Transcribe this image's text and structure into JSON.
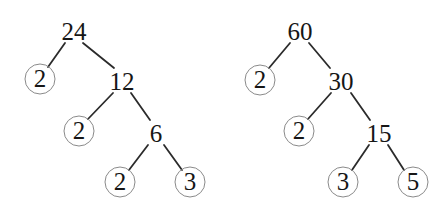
{
  "figure": {
    "type": "factor-tree-diagram",
    "background_color": "#ffffff",
    "edge_color": "#2b2b2b",
    "circle_stroke_color": "#8a8a8a",
    "text_color": "#161616"
  },
  "trees": [
    {
      "name": "factor-tree-24",
      "root_value": "24",
      "prime_factors": [
        "2",
        "2",
        "2",
        "3"
      ],
      "nodes": [
        {
          "id": "t1-24",
          "label": "24",
          "circled": false,
          "x": 74,
          "y": 31
        },
        {
          "id": "t1-2a",
          "label": "2",
          "circled": true,
          "x": 40,
          "y": 79
        },
        {
          "id": "t1-12",
          "label": "12",
          "circled": false,
          "x": 122,
          "y": 81
        },
        {
          "id": "t1-2b",
          "label": "2",
          "circled": true,
          "x": 79,
          "y": 131
        },
        {
          "id": "t1-6",
          "label": "6",
          "circled": false,
          "x": 156,
          "y": 133
        },
        {
          "id": "t1-2c",
          "label": "2",
          "circled": true,
          "x": 120,
          "y": 182
        },
        {
          "id": "t1-3",
          "label": "3",
          "circled": true,
          "x": 190,
          "y": 182
        }
      ],
      "edges": [
        {
          "from": "t1-24",
          "to": "t1-2a",
          "x1": 65,
          "y1": 43,
          "x2": 48,
          "y2": 67
        },
        {
          "from": "t1-24",
          "to": "t1-12",
          "x1": 83,
          "y1": 43,
          "x2": 114,
          "y2": 68
        },
        {
          "from": "t1-12",
          "to": "t1-2b",
          "x1": 113,
          "y1": 93,
          "x2": 88,
          "y2": 119
        },
        {
          "from": "t1-12",
          "to": "t1-6",
          "x1": 131,
          "y1": 93,
          "x2": 150,
          "y2": 120
        },
        {
          "from": "t1-6",
          "to": "t1-2c",
          "x1": 148,
          "y1": 145,
          "x2": 129,
          "y2": 170
        },
        {
          "from": "t1-6",
          "to": "t1-3",
          "x1": 164,
          "y1": 145,
          "x2": 182,
          "y2": 170
        }
      ]
    },
    {
      "name": "factor-tree-60",
      "root_value": "60",
      "prime_factors": [
        "2",
        "2",
        "3",
        "5"
      ],
      "nodes": [
        {
          "id": "t2-60",
          "label": "60",
          "circled": false,
          "x": 300,
          "y": 31
        },
        {
          "id": "t2-2a",
          "label": "2",
          "circled": true,
          "x": 260,
          "y": 80
        },
        {
          "id": "t2-30",
          "label": "30",
          "circled": false,
          "x": 341,
          "y": 81
        },
        {
          "id": "t2-2b",
          "label": "2",
          "circled": true,
          "x": 299,
          "y": 131
        },
        {
          "id": "t2-15",
          "label": "15",
          "circled": false,
          "x": 379,
          "y": 133
        },
        {
          "id": "t2-3",
          "label": "3",
          "circled": true,
          "x": 343,
          "y": 182
        },
        {
          "id": "t2-5",
          "label": "5",
          "circled": true,
          "x": 413,
          "y": 182
        }
      ],
      "edges": [
        {
          "from": "t2-60",
          "to": "t2-2a",
          "x1": 290,
          "y1": 43,
          "x2": 269,
          "y2": 68
        },
        {
          "from": "t2-60",
          "to": "t2-30",
          "x1": 309,
          "y1": 43,
          "x2": 330,
          "y2": 68
        },
        {
          "from": "t2-30",
          "to": "t2-2b",
          "x1": 331,
          "y1": 93,
          "x2": 308,
          "y2": 119
        },
        {
          "from": "t2-30",
          "to": "t2-15",
          "x1": 351,
          "y1": 93,
          "x2": 370,
          "y2": 120
        },
        {
          "from": "t2-15",
          "to": "t2-3",
          "x1": 369,
          "y1": 145,
          "x2": 352,
          "y2": 170
        },
        {
          "from": "t2-15",
          "to": "t2-5",
          "x1": 388,
          "y1": 145,
          "x2": 404,
          "y2": 170
        }
      ]
    }
  ]
}
